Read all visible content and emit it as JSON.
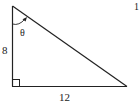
{
  "diagram": {
    "type": "right-triangle",
    "vertical_leg_label": "8",
    "horizontal_leg_label": "12",
    "angle_label": "θ",
    "angle_position": "top vertex, between vertical leg and hypotenuse",
    "right_angle_marker": "bottom-left corner",
    "corner_number": "1"
  },
  "colors": {
    "stroke": "#222222",
    "background": "#ffffff"
  }
}
